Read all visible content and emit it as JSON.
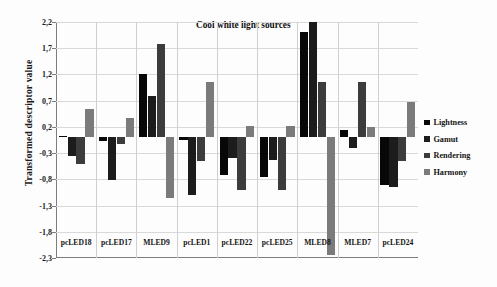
{
  "chart_data": {
    "type": "bar",
    "title": "Cool white light sources",
    "xlabel": "",
    "ylabel": "Transformed descriptor value",
    "ylim": [
      -2.3,
      2.2
    ],
    "yticks": [
      2.2,
      1.7,
      1.2,
      0.7,
      0.2,
      -0.3,
      -0.8,
      -1.3,
      -1.8,
      -2.3
    ],
    "ytick_labels": [
      "2,2",
      "1,7",
      "1,2",
      "0,7",
      "0,2",
      "-0,3",
      "-0,8",
      "-1,3",
      "-1,8",
      "-2,3"
    ],
    "grid": true,
    "legend_position": "right",
    "categories": [
      "pcLED18",
      "pcLED17",
      "MLED9",
      "pcLED1",
      "pcLED22",
      "pcLED25",
      "MLED8",
      "MLED7",
      "pcLED24"
    ],
    "series": [
      {
        "name": "Lightness",
        "color": "#080808",
        "values": [
          0.03,
          -0.07,
          1.2,
          -0.05,
          -0.72,
          -0.75,
          2.0,
          0.15,
          -0.9
        ]
      },
      {
        "name": "Gamut",
        "color": "#1c1c1c",
        "values": [
          -0.35,
          -0.82,
          0.78,
          -1.1,
          -0.4,
          -0.43,
          2.2,
          -0.2,
          -0.95
        ]
      },
      {
        "name": "Rendering",
        "color": "#3c3c3c",
        "values": [
          -0.5,
          -0.12,
          1.78,
          -0.45,
          -1.0,
          -1.0,
          1.05,
          1.05,
          -0.45
        ]
      },
      {
        "name": "Harmony",
        "color": "#7b7b7b",
        "values": [
          0.55,
          0.37,
          -1.15,
          1.05,
          0.21,
          0.21,
          -2.25,
          0.2,
          0.68
        ]
      }
    ]
  },
  "legend": {
    "items": [
      {
        "label": "Lightness"
      },
      {
        "label": "Gamut"
      },
      {
        "label": "Rendering"
      },
      {
        "label": "Harmony"
      }
    ]
  }
}
